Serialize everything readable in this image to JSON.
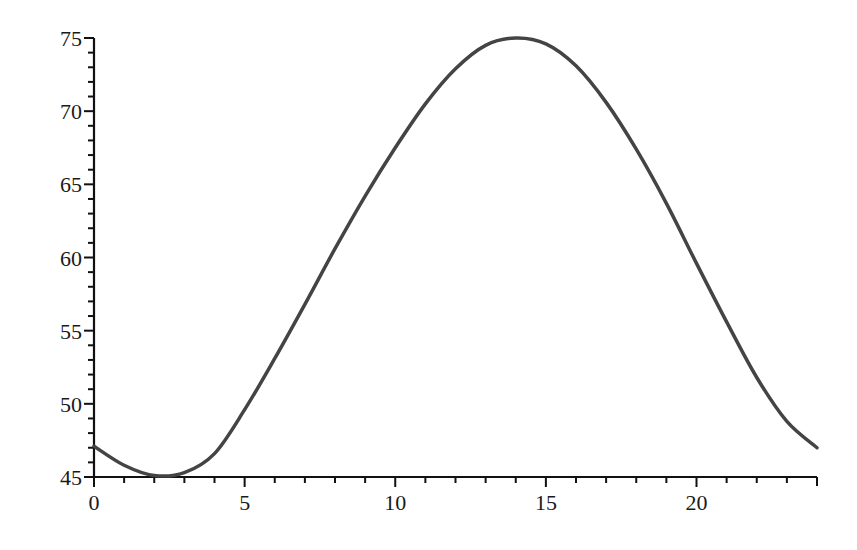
{
  "chart_data": {
    "type": "line",
    "title": "",
    "xlabel": "",
    "ylabel": "",
    "xlim": [
      0,
      24
    ],
    "ylim": [
      45,
      75
    ],
    "grid": false,
    "legend": "none",
    "x_major_ticks": [
      0,
      5,
      10,
      15,
      20
    ],
    "x_tick_labels": [
      "0",
      "5",
      "10",
      "15",
      "20"
    ],
    "x_minor_step": 1,
    "y_major_ticks": [
      45,
      50,
      55,
      60,
      65,
      70,
      75
    ],
    "y_tick_labels": [
      "45",
      "50",
      "55",
      "60",
      "65",
      "70",
      "75"
    ],
    "y_minor_step": 1,
    "series": [
      {
        "name": "curve",
        "color": "#444444",
        "x": [
          0,
          1,
          2,
          3,
          4,
          5,
          6,
          7,
          8,
          9,
          10,
          11,
          12,
          13,
          14,
          15,
          16,
          17,
          18,
          19,
          20,
          21,
          22,
          23,
          24
        ],
        "values": [
          47.1,
          45.8,
          45.1,
          45.3,
          46.6,
          49.6,
          53.1,
          56.8,
          60.6,
          64.2,
          67.5,
          70.5,
          72.9,
          74.5,
          75.0,
          74.6,
          73.1,
          70.6,
          67.4,
          63.7,
          59.6,
          55.6,
          51.8,
          48.8,
          47.0
        ]
      }
    ]
  }
}
